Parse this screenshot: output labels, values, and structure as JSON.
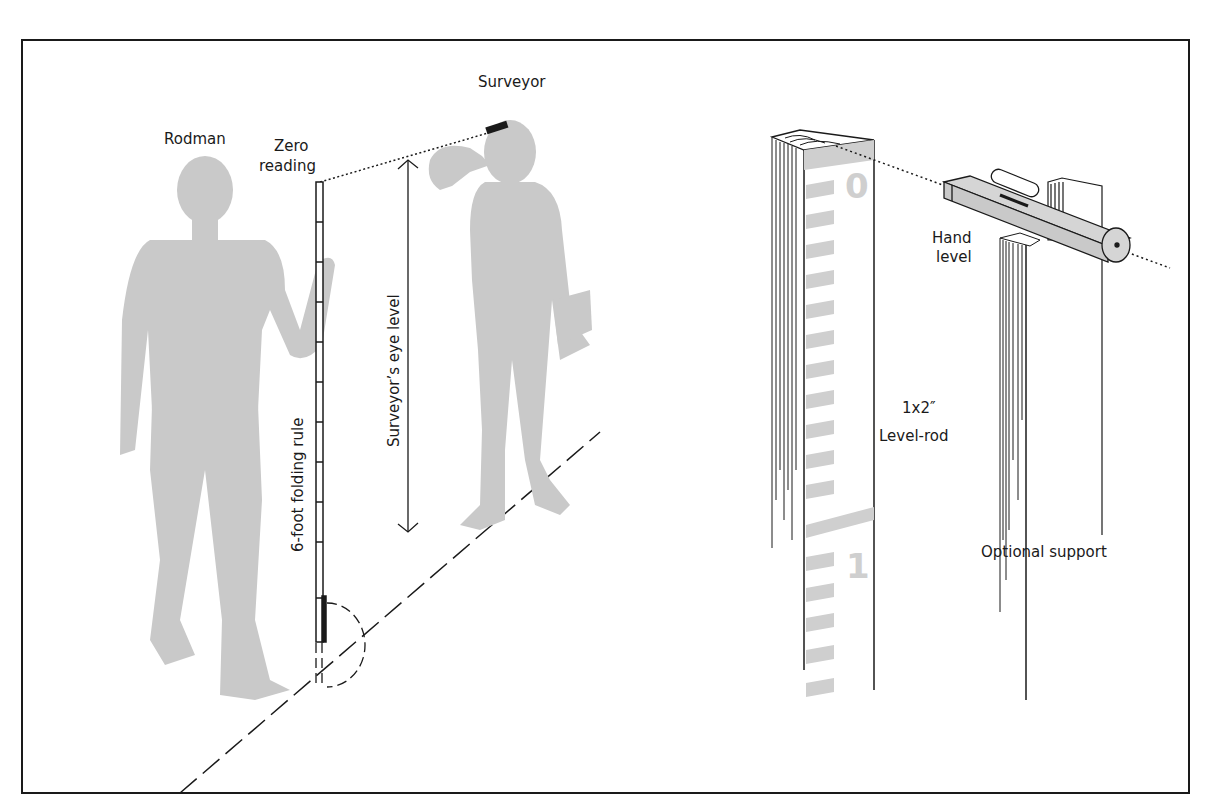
{
  "figure": {
    "frame_color": "#1a1a1a",
    "silhouette_color": "#c9c9c9",
    "scale_color": "#cfcfcf",
    "labels": {
      "rodman": "Rodman",
      "surveyor": "Surveyor",
      "zero_reading_line1": "Zero",
      "zero_reading_line2": "reading",
      "folding_rule": "6-foot folding rule",
      "eye_level": "Surveyor’s eye level",
      "hand_level_line1": "Hand",
      "hand_level_line2": "level",
      "level_rod_line1": "1x2″",
      "level_rod_line2": "Level-rod",
      "optional_support": "Optional support"
    },
    "rod_numerals": {
      "zero": "0",
      "one": "1"
    }
  }
}
